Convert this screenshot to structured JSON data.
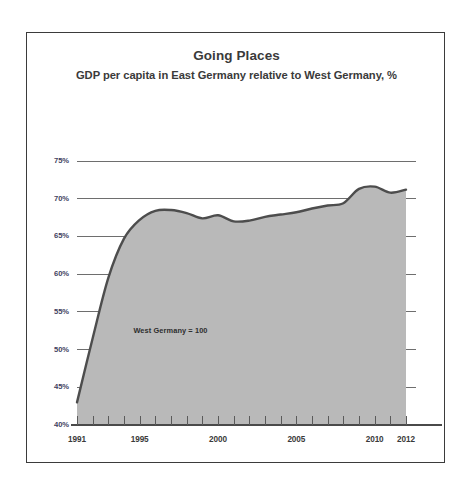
{
  "figure": {
    "background_color": "#ffffff",
    "frame_color": "#3b3b3b"
  },
  "chart_data": {
    "type": "area",
    "title": "Going Places",
    "subtitle": "GDP per capita in East Germany relative to West Germany, %",
    "xlabel": "",
    "ylabel": "",
    "xlim": [
      1991,
      2012.4
    ],
    "ylim": [
      40,
      75
    ],
    "grid": true,
    "grid_axis": "y",
    "legend": false,
    "legend_position": "none",
    "annotations": [
      {
        "text": "West Germany = 100",
        "x": 1994.6,
        "y": 52.6
      }
    ],
    "ytick_labels": [
      "75%",
      "70%",
      "65%",
      "60%",
      "55%",
      "50%",
      "45%",
      "40%"
    ],
    "ytick_values": [
      75,
      70,
      65,
      60,
      55,
      50,
      45,
      40
    ],
    "xtick_labels": [
      "1991",
      "1995",
      "2000",
      "2005",
      "2010",
      "2012"
    ],
    "xtick_values": [
      1991,
      1995,
      2000,
      2005,
      2010,
      2012
    ],
    "x_minor_ticks": [
      1991,
      1992,
      1993,
      1994,
      1995,
      1996,
      1997,
      1998,
      1999,
      2000,
      2001,
      2002,
      2003,
      2004,
      2005,
      2006,
      2007,
      2008,
      2009,
      2010,
      2011,
      2012
    ],
    "series": [
      {
        "name": "GDP per capita in East Germany relative to West Germany",
        "line_color": "#4d4d4d",
        "fill_color": "#b9b9b9",
        "x": [
          1991,
          1992,
          1993,
          1994,
          1995,
          1996,
          1997,
          1998,
          1999,
          2000,
          2001,
          2002,
          2003,
          2004,
          2005,
          2006,
          2007,
          2008,
          2009,
          2010,
          2011,
          2012
        ],
        "values": [
          43.0,
          51.5,
          59.5,
          64.7,
          67.2,
          68.4,
          68.5,
          68.1,
          67.4,
          67.8,
          67.0,
          67.1,
          67.6,
          67.9,
          68.2,
          68.7,
          69.1,
          69.4,
          71.3,
          71.6,
          70.8,
          71.2
        ]
      }
    ]
  }
}
